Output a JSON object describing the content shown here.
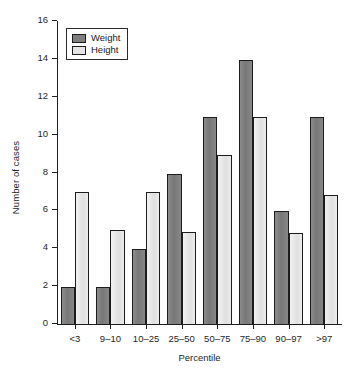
{
  "chart_data": {
    "type": "bar",
    "title": "",
    "xlabel": "Percentile",
    "ylabel": "Number of cases",
    "categories": [
      "<3",
      "9–10",
      "10–25",
      "25–50",
      "50–75",
      "75–90",
      "90–97",
      ">97"
    ],
    "series": [
      {
        "name": "Weight",
        "color": "#7e7e7e",
        "values": [
          2,
          2,
          4,
          8,
          11,
          14,
          6,
          11
        ]
      },
      {
        "name": "Height",
        "color": "#e4e4e4",
        "values": [
          7,
          5,
          7,
          4.9,
          9,
          11,
          4.85,
          6.85
        ]
      }
    ],
    "ylim": [
      0,
      16
    ],
    "yticks": [
      0,
      2,
      4,
      6,
      8,
      10,
      12,
      14,
      16
    ],
    "ytick_labels": [
      "0",
      "2",
      "4",
      "6",
      "8",
      "10",
      "12",
      "14",
      "16"
    ],
    "grid": false,
    "legend_position": "upper left",
    "legend_entries": [
      "Weight",
      "Height"
    ],
    "axis_color": "#1f1f1f",
    "background": "#ffffff"
  }
}
